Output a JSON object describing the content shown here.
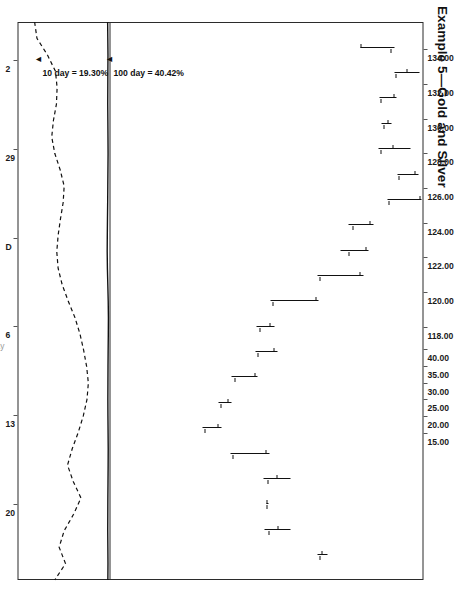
{
  "figure": {
    "title": "Example 5—Gold and Silver",
    "x_caption": "Day"
  },
  "axes": {
    "price_axis": {
      "position": "left",
      "labels": [
        "134.00",
        "132.00",
        "130.00",
        "128.00",
        "126.00",
        "124.00",
        "122.00",
        "120.00",
        "118.00"
      ],
      "min": 117.0,
      "max": 135.0
    },
    "volatility_axis": {
      "position": "right",
      "labels": [
        "40.00",
        "35.00",
        "30.00",
        "25.00",
        "20.00",
        "15.00"
      ],
      "min": 13.5,
      "max": 41.5
    },
    "time_axis": {
      "labels": [
        "2",
        "29",
        "D",
        "6",
        "13",
        "20"
      ]
    }
  },
  "annotations": [
    {
      "name": "hundred-day-volatility",
      "text": "100 day = 40.42%",
      "value": 40.42
    },
    {
      "name": "ten-day-volatility",
      "text": "10 day = 19.30%",
      "value": 19.3
    }
  ],
  "colors": {
    "ink": "#111111",
    "frame": "#2b2b2b",
    "paper": "#ffffff",
    "faint": "#9a9a9a"
  },
  "chart_data": {
    "type": "line",
    "title": "Example 5—Gold and Silver",
    "xlabel": "Day",
    "ylabel": "Price",
    "grid": false,
    "legend": "none",
    "panels": [
      {
        "name": "price",
        "type": "ohlc-bar",
        "ylabel": "Price",
        "ylim": [
          117.0,
          135.0
        ],
        "yticks": [
          134.0,
          132.0,
          130.0,
          128.0,
          126.0,
          124.0,
          122.0,
          120.0,
          118.0
        ],
        "bars": [
          {
            "i": 1,
            "high": 133.3,
            "low": 131.35,
            "open": 131.45,
            "close": 133.15
          },
          {
            "i": 2,
            "high": 134.75,
            "low": 133.35,
            "open": 134.05,
            "close": 133.45
          },
          {
            "i": 3,
            "high": 133.45,
            "low": 132.45,
            "open": 133.3,
            "close": 132.55
          },
          {
            "i": 4,
            "high": 133.15,
            "low": 132.6,
            "open": 133.0,
            "close": 132.75
          },
          {
            "i": 5,
            "high": 134.25,
            "low": 132.4,
            "open": 133.25,
            "close": 132.55
          },
          {
            "i": 6,
            "high": 134.7,
            "low": 133.5,
            "open": 134.55,
            "close": 133.6
          },
          {
            "i": 7,
            "high": 134.9,
            "low": 132.95,
            "open": 134.85,
            "close": 133.05
          },
          {
            "i": 8,
            "high": 132.1,
            "low": 130.7,
            "open": 131.95,
            "close": 130.95
          },
          {
            "i": 9,
            "high": 131.85,
            "low": 130.2,
            "open": 131.7,
            "close": 130.75
          },
          {
            "i": 10,
            "high": 131.55,
            "low": 128.9,
            "open": 131.35,
            "close": 129.05
          },
          {
            "i": 11,
            "high": 128.95,
            "low": 126.15,
            "open": 128.8,
            "close": 126.35
          },
          {
            "i": 12,
            "high": 126.4,
            "low": 125.35,
            "open": 126.2,
            "close": 125.6
          },
          {
            "i": 13,
            "high": 126.55,
            "low": 125.3,
            "open": 126.4,
            "close": 125.5
          },
          {
            "i": 14,
            "high": 125.45,
            "low": 123.95,
            "open": 125.3,
            "close": 124.15
          },
          {
            "i": 15,
            "high": 123.9,
            "low": 123.15,
            "open": 123.75,
            "close": 123.35
          },
          {
            "i": 16,
            "high": 123.35,
            "low": 122.25,
            "open": 123.2,
            "close": 122.45
          },
          {
            "i": 17,
            "high": 126.1,
            "low": 123.85,
            "open": 125.95,
            "close": 124.05
          },
          {
            "i": 18,
            "high": 127.35,
            "low": 125.75,
            "open": 126.6,
            "close": 126.05
          },
          {
            "i": 19,
            "high": 126.05,
            "low": 125.95,
            "open": 126.0,
            "close": 126.0
          },
          {
            "i": 20,
            "high": 127.3,
            "low": 125.85,
            "open": 126.65,
            "close": 126.1
          },
          {
            "i": 21,
            "high": 129.45,
            "low": 128.9,
            "open": 129.2,
            "close": 129.05
          }
        ]
      },
      {
        "name": "volatility",
        "type": "line",
        "ylabel": "Volatility (%)",
        "ylim": [
          13.5,
          41.5
        ],
        "yticks": [
          40,
          35,
          30,
          25,
          20,
          15
        ],
        "series": [
          {
            "name": "100 day",
            "style": "solid",
            "final_value": 40.42,
            "values": [
              40.35,
              40.4,
              40.45,
              40.42,
              40.4,
              40.38,
              40.42,
              40.45,
              40.48,
              40.44,
              40.4,
              40.36,
              40.3,
              40.25,
              40.22,
              40.28,
              40.4,
              40.52,
              40.58,
              40.55,
              40.5,
              40.46,
              40.44,
              40.42,
              40.44,
              40.48,
              40.52,
              40.5,
              40.46,
              40.42,
              40.4,
              40.38,
              40.42,
              40.45,
              40.42
            ]
          },
          {
            "name": "10 day",
            "style": "dashed",
            "final_value": 19.3,
            "values": [
              18.6,
              19.3,
              22.4,
              24.8,
              25.3,
              25.1,
              24.2,
              23.7,
              24.6,
              26.2,
              27.4,
              27.1,
              26.3,
              25.6,
              25.2,
              25.6,
              26.8,
              28.6,
              30.6,
              32.1,
              33.2,
              34.1,
              34.6,
              34.2,
              33.1,
              31.6,
              29.8,
              28.4,
              30.1,
              32.4,
              30.2,
              27.4,
              25.9,
              27.8,
              24.6
            ]
          }
        ]
      }
    ]
  }
}
